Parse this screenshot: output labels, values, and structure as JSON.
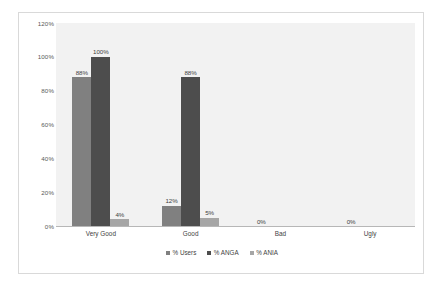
{
  "chart_data": {
    "type": "bar",
    "title": "",
    "subtitle": "",
    "xlabel": "",
    "ylabel": "",
    "categories": [
      "Very Good",
      "Good",
      "Bad",
      "Ugly"
    ],
    "series": [
      {
        "name": "% Users",
        "color": "#808080",
        "values": [
          88,
          12,
          0,
          0
        ],
        "labels": [
          "88%",
          "12%",
          "0%",
          "0%"
        ]
      },
      {
        "name": "% ANGA",
        "color": "#4d4d4d",
        "values": [
          100,
          88,
          0,
          0
        ],
        "labels": [
          "100%",
          "88%",
          "",
          ""
        ]
      },
      {
        "name": "% ANIA",
        "color": "#a6a6a6",
        "values": [
          4,
          5,
          0,
          0
        ],
        "labels": [
          "4%",
          "5%",
          "",
          ""
        ]
      }
    ],
    "ylim": [
      0,
      120
    ],
    "y_ticks": [
      0,
      20,
      40,
      60,
      80,
      100,
      120
    ],
    "y_tick_labels": [
      "0%",
      "20%",
      "40%",
      "60%",
      "80%",
      "100%",
      "120%"
    ],
    "grid": false,
    "legend_position": "bottom",
    "plot_background": "#f2f2f2",
    "frame_border_color": "#d9d9d9",
    "axis_line_color": "#b7b7b7",
    "label_text_color": "#3f3f3f",
    "tick_text_color": "#595959"
  }
}
